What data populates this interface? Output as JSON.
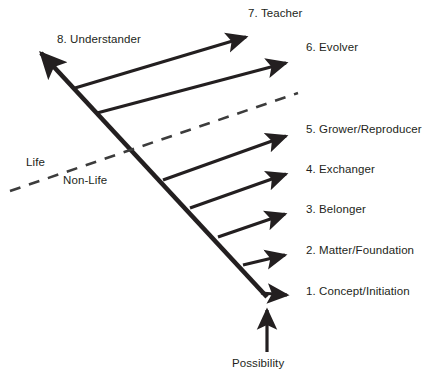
{
  "diagram": {
    "colors": {
      "line": "#231f20",
      "text": "#231f20",
      "background": "#ffffff",
      "dashed_divider": "#4d4d4d"
    },
    "spine": {
      "name": "main-diagonal-arrow",
      "from_label": "1. Concept/Initiation",
      "to_label": "8. Understander"
    },
    "stages": [
      {
        "number": "8",
        "label": "8. Understander",
        "position": "upper-left-tip",
        "x": 57,
        "y": 33
      },
      {
        "number": "7",
        "label": "7. Teacher",
        "position": "top",
        "x": 248,
        "y": 9
      },
      {
        "number": "6",
        "label": "6. Evolver",
        "position": "right",
        "x": 305,
        "y": 43
      },
      {
        "number": "5",
        "label": "5. Grower/Reproducer",
        "position": "right",
        "x": 305,
        "y": 124
      },
      {
        "number": "4",
        "label": "4. Exchanger",
        "position": "right",
        "x": 305,
        "y": 163
      },
      {
        "number": "3",
        "label": "3. Belonger",
        "position": "right",
        "x": 305,
        "y": 203
      },
      {
        "number": "2",
        "label": "2. Matter/Foundation",
        "position": "right",
        "x": 305,
        "y": 244
      },
      {
        "number": "1",
        "label": "1. Concept/Initiation",
        "position": "right",
        "x": 305,
        "y": 285
      }
    ],
    "divider": {
      "name": "life-nonlife-divider",
      "style": "dashed",
      "above_label": "Life",
      "below_label": "Non-Life",
      "above_label_x": 26,
      "above_label_y": 156,
      "below_label_x": 63,
      "below_label_y": 174
    },
    "origin": {
      "name": "possibility-input",
      "label": "Possibility",
      "x": 232,
      "y": 358
    }
  },
  "geometry": {
    "spine": {
      "x1": 267,
      "y1": 297,
      "x2": 38,
      "y2": 50
    },
    "branch_arrows": [
      {
        "name": "arrow-to-teacher",
        "x1": 75,
        "y1": 88,
        "x2": 251,
        "y2": 35
      },
      {
        "name": "arrow-to-evolver",
        "x1": 97,
        "y1": 113,
        "x2": 291,
        "y2": 62
      },
      {
        "name": "arrow-to-grower",
        "x1": 163,
        "y1": 180,
        "x2": 291,
        "y2": 135
      },
      {
        "name": "arrow-to-exchanger",
        "x1": 190,
        "y1": 208,
        "x2": 291,
        "y2": 173
      },
      {
        "name": "arrow-to-belonger",
        "x1": 218,
        "y1": 237,
        "x2": 289,
        "y2": 213
      },
      {
        "name": "arrow-to-matter",
        "x1": 243,
        "y1": 265,
        "x2": 289,
        "y2": 254
      },
      {
        "name": "arrow-to-concept",
        "x1": 262,
        "y1": 293,
        "x2": 291,
        "y2": 294
      }
    ],
    "divider_line": {
      "x1": 10,
      "y1": 191,
      "x2": 298,
      "y2": 93
    },
    "origin_arrow": {
      "x1": 267,
      "y1": 352,
      "x2": 267,
      "y2": 305
    }
  }
}
